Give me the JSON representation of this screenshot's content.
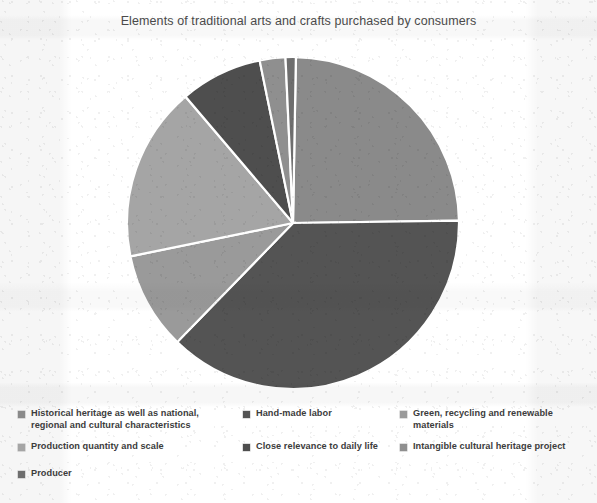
{
  "chart_data": {
    "type": "pie",
    "title": "Elements of traditional arts and crafts purchased by consumers",
    "xlabel": "",
    "ylabel": "",
    "grid": false,
    "legend_position": "bottom",
    "legend_columns": 3,
    "labels": [
      "Historical heritage as well as national, regional and cultural characteristics",
      "Hand-made labor",
      "Green, recycling and renewable materials",
      "Production quantity and scale",
      "Close relevance to daily life",
      "Intangible cultural heritage project",
      "Producer"
    ],
    "values": [
      24.5,
      37.5,
      9.5,
      17.0,
      8.0,
      2.5,
      1.0
    ],
    "colors": [
      "#8a8a8a",
      "#545454",
      "#9a9a9a",
      "#a5a5a5",
      "#4e4e4e",
      "#8f8f8f",
      "#6e6e6e"
    ],
    "start_angle_deg": 1
  },
  "legend": {
    "items": [
      {
        "label": "Historical heritage as well as national, regional and cultural characteristics",
        "color": "#8a8a8a",
        "column": 1,
        "row": "a"
      },
      {
        "label": "Production quantity and scale",
        "color": "#a5a5a5",
        "column": 1,
        "row": "b"
      },
      {
        "label": "Producer",
        "color": "#6e6e6e",
        "column": 1,
        "row": "c"
      },
      {
        "label": "Hand-made labor",
        "color": "#545454",
        "column": 2,
        "row": "a"
      },
      {
        "label": "Close relevance to daily life",
        "color": "#4e4e4e",
        "column": 2,
        "row": "b"
      },
      {
        "label": "Green, recycling and renewable materials",
        "color": "#9a9a9a",
        "column": 3,
        "row": "a"
      },
      {
        "label": "Intangible cultural heritage project",
        "color": "#8f8f8f",
        "column": 3,
        "row": "b"
      }
    ]
  }
}
